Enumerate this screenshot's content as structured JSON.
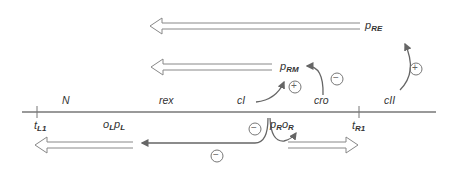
{
  "diagram": {
    "type": "genetic-map",
    "colors": {
      "line": "#666666",
      "arrow_outline": "#888888",
      "text": "#333333",
      "background": "#ffffff"
    },
    "genes": [
      {
        "id": "N",
        "label": "N"
      },
      {
        "id": "rex",
        "label": "rex"
      },
      {
        "id": "cI",
        "label": "cI"
      },
      {
        "id": "cro",
        "label": "cro"
      },
      {
        "id": "cII",
        "label": "cII"
      }
    ],
    "terminators": [
      {
        "id": "tL1",
        "main": "t",
        "sub": "L1"
      },
      {
        "id": "tR1",
        "main": "t",
        "sub": "R1"
      }
    ],
    "promoters": {
      "pRE": {
        "main": "p",
        "sub": "RE"
      },
      "pRM": {
        "main": "p",
        "sub": "RM"
      },
      "oLpL": {
        "o": "o",
        "o_sub": "L",
        "p": "p",
        "p_sub": "L"
      },
      "pRoR": {
        "p": "p",
        "p_sub": "R",
        "o": "o",
        "o_sub": "R"
      }
    },
    "regulation_signs": {
      "cII_to_pRE": "+",
      "cI_to_pRM": "+",
      "cro_to_pRM": "−",
      "cI_repress_pR": "−",
      "cI_repress_pL": "−"
    }
  }
}
